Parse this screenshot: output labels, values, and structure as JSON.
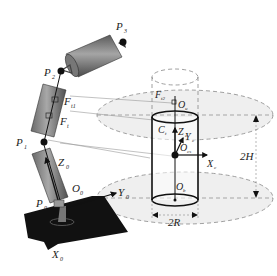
{
  "diagram": {
    "type": "robot-arm-cylinder-workspace",
    "joints": [
      {
        "id": "P0",
        "label": "P",
        "sub": "0"
      },
      {
        "id": "P1",
        "label": "P",
        "sub": "1"
      },
      {
        "id": "P2",
        "label": "P",
        "sub": "2"
      },
      {
        "id": "P3",
        "label": "P",
        "sub": "3"
      }
    ],
    "base_frame": {
      "origin": {
        "label": "O",
        "sub": "0"
      },
      "x_axis": {
        "label": "X",
        "sub": "0"
      },
      "y_axis": {
        "label": "Y",
        "sub": "0"
      },
      "z_axis": {
        "label": "Z",
        "sub": "0"
      }
    },
    "force_labels": [
      {
        "label": "F",
        "sub": "t1"
      },
      {
        "label": "F",
        "sub": "t"
      },
      {
        "label": "F",
        "sub": "t2"
      }
    ],
    "cylinder_frame": {
      "center": {
        "label": "C",
        "sub": "t"
      },
      "origin": {
        "label": "O",
        "sub": "cs"
      },
      "x_axis": {
        "label": "X",
        "sub": "c"
      },
      "y_axis": {
        "label": "Y",
        "sub": "c"
      },
      "z_axis": {
        "label": "Z",
        "sub": "c"
      },
      "top_point": {
        "label": "O",
        "sub": "u"
      },
      "bottom_point": {
        "label": "O",
        "sub": "b"
      }
    },
    "dimensions": {
      "height": "2H",
      "diameter": "2R"
    },
    "colors": {
      "ellipse_fill": "#eeeeee",
      "link_dark": "#555555",
      "link_light": "#9a9a9a",
      "base_plate": "#111111",
      "line": "#222222"
    }
  }
}
